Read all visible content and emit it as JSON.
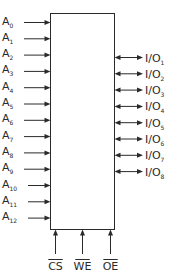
{
  "diagram": {
    "title": "",
    "chip_block": {
      "label": ""
    },
    "address_inputs": [
      {
        "base": "A",
        "sub": "0"
      },
      {
        "base": "A",
        "sub": "1"
      },
      {
        "base": "A",
        "sub": "2"
      },
      {
        "base": "A",
        "sub": "3"
      },
      {
        "base": "A",
        "sub": "4"
      },
      {
        "base": "A",
        "sub": "5"
      },
      {
        "base": "A",
        "sub": "6"
      },
      {
        "base": "A",
        "sub": "7"
      },
      {
        "base": "A",
        "sub": "8"
      },
      {
        "base": "A",
        "sub": "9"
      },
      {
        "base": "A",
        "sub": "10"
      },
      {
        "base": "A",
        "sub": "11"
      },
      {
        "base": "A",
        "sub": "12"
      }
    ],
    "data_io": [
      {
        "base": "I/O",
        "sub": "1"
      },
      {
        "base": "I/O",
        "sub": "2"
      },
      {
        "base": "I/O",
        "sub": "3"
      },
      {
        "base": "I/O",
        "sub": "4"
      },
      {
        "base": "I/O",
        "sub": "5"
      },
      {
        "base": "I/O",
        "sub": "6"
      },
      {
        "base": "I/O",
        "sub": "7"
      },
      {
        "base": "I/O",
        "sub": "8"
      }
    ],
    "control_inputs": [
      {
        "label": "CS",
        "active_low": true
      },
      {
        "label": "WE",
        "active_low": true
      },
      {
        "label": "OE",
        "active_low": true
      }
    ],
    "colors": {
      "line": "#2a2a2a",
      "background": "#ffffff"
    }
  }
}
